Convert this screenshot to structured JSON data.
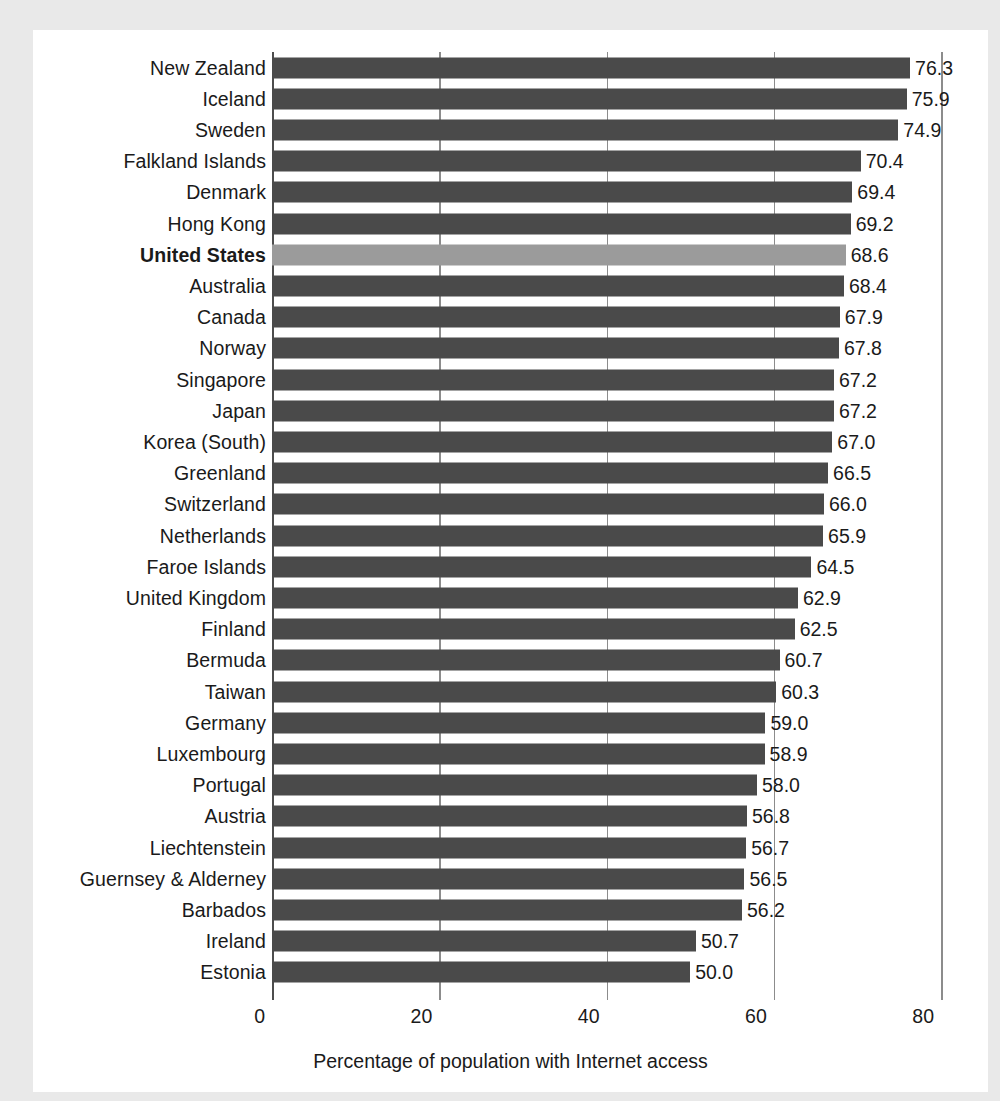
{
  "chart_data": {
    "type": "bar",
    "orientation": "horizontal",
    "title": "",
    "xlabel": "Percentage of population with Internet access",
    "ylabel": "",
    "xlim": [
      0,
      80
    ],
    "xticks": [
      0,
      20,
      40,
      60,
      80
    ],
    "xtick_labels": [
      "0",
      "20",
      "40",
      "60",
      "80"
    ],
    "grid": true,
    "legend": "none",
    "value_label_format": "one-decimal",
    "colors": {
      "bar": "#4a4a4a",
      "highlight_bar": "#9b9b9b",
      "text": "#1a1a1a",
      "gridline": "#8c8c8c",
      "panel_background": "#ffffff",
      "page_background": "#e9e9e9"
    },
    "highlight_category": "United States",
    "categories": [
      "New Zealand",
      "Iceland",
      "Sweden",
      "Falkland Islands",
      "Denmark",
      "Hong Kong",
      "United States",
      "Australia",
      "Canada",
      "Norway",
      "Singapore",
      "Japan",
      "Korea (South)",
      "Greenland",
      "Switzerland",
      "Netherlands",
      "Faroe Islands",
      "United Kingdom",
      "Finland",
      "Bermuda",
      "Taiwan",
      "Germany",
      "Luxembourg",
      "Portugal",
      "Austria",
      "Liechtenstein",
      "Guernsey & Alderney",
      "Barbados",
      "Ireland",
      "Estonia"
    ],
    "values": [
      76.3,
      75.9,
      74.9,
      70.4,
      69.4,
      69.2,
      68.6,
      68.4,
      67.9,
      67.8,
      67.2,
      67.2,
      67.0,
      66.5,
      66.0,
      65.9,
      64.5,
      62.9,
      62.5,
      60.7,
      60.3,
      59.0,
      58.9,
      58.0,
      56.8,
      56.7,
      56.5,
      56.2,
      50.7,
      50.0
    ],
    "value_labels": [
      "76.3",
      "75.9",
      "74.9",
      "70.4",
      "69.4",
      "69.2",
      "68.6",
      "68.4",
      "67.9",
      "67.8",
      "67.2",
      "67.2",
      "67.0",
      "66.5",
      "66.0",
      "65.9",
      "64.5",
      "62.9",
      "62.5",
      "60.7",
      "60.3",
      "59.0",
      "58.9",
      "58.0",
      "56.8",
      "56.7",
      "56.5",
      "56.2",
      "50.7",
      "50.0"
    ]
  }
}
